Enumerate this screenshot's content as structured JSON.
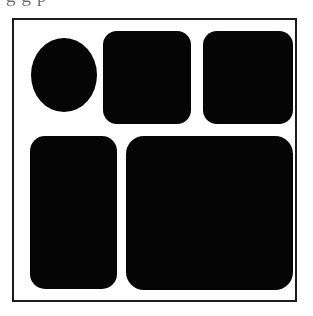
{
  "page": {
    "width": 313,
    "height": 316,
    "background_color": "#ffffff",
    "kind": "scanned-figure"
  },
  "clipped_caption": {
    "visible_fragment": "g   g   p",
    "note": "bottom descenders of a text line cropped at the top edge"
  },
  "frame": {
    "label": "figure-border",
    "x": 12,
    "y": 18,
    "width": 285,
    "height": 284,
    "border_width": 2,
    "border_color": "#1b1b1b",
    "fill_color": "#ffffff"
  },
  "diagram_data": {
    "type": "shape-layout",
    "shape_fill_color": "#050505",
    "rows": 2,
    "shape_count": 5,
    "coordinate_space": {
      "origin": "frame-inner-top-left",
      "width": 281,
      "height": 280
    },
    "shapes": [
      {
        "id": "shape-1",
        "name": "ellipse-top-left",
        "type": "ellipse",
        "row": 1,
        "column": 1,
        "cx": 50,
        "cy": 55,
        "rx": 33,
        "ry": 37,
        "fill": "#050505"
      },
      {
        "id": "shape-2",
        "name": "rounded-square-top-middle",
        "type": "rounded-rect",
        "row": 1,
        "column": 2,
        "x": 89,
        "y": 11,
        "width": 88,
        "height": 93,
        "corner_radius": 14,
        "fill": "#050505"
      },
      {
        "id": "shape-3",
        "name": "rounded-square-top-right",
        "type": "rounded-rect",
        "row": 1,
        "column": 3,
        "x": 189,
        "y": 11,
        "width": 90,
        "height": 93,
        "corner_radius": 14,
        "fill": "#050505"
      },
      {
        "id": "shape-4",
        "name": "rounded-rect-bottom-left",
        "type": "rounded-rect",
        "row": 2,
        "column": 1,
        "x": 16,
        "y": 116,
        "width": 87,
        "height": 153,
        "corner_radius": 15,
        "fill": "#050505"
      },
      {
        "id": "shape-5",
        "name": "rounded-rect-bottom-right",
        "type": "rounded-rect",
        "row": 2,
        "column": 2,
        "x": 112,
        "y": 116,
        "width": 167,
        "height": 154,
        "corner_radius": 18,
        "fill": "#050505"
      }
    ]
  }
}
